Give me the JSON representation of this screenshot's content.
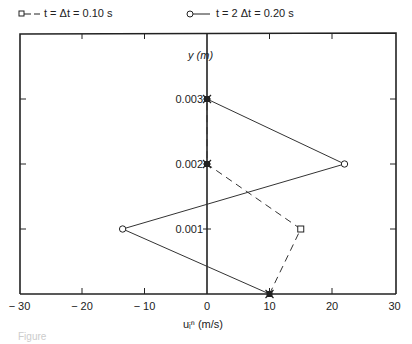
{
  "legend": {
    "series1_label": "t = Δt = 0.10 s",
    "series2_label": "t = 2 Δt = 0.20 s"
  },
  "axes": {
    "x_label": "uᵢⁿ  (m/s)",
    "y_label": "y (m)"
  },
  "caption": "Figure",
  "chart_data": {
    "type": "line",
    "title": "",
    "xlabel": "u (m/s)",
    "ylabel": "y (m)",
    "xlim": [
      -30,
      30
    ],
    "ylim": [
      0,
      0.004
    ],
    "x_ticks": [
      -30,
      -20,
      -10,
      0,
      10,
      20,
      30
    ],
    "x_tick_labels": [
      "− 30",
      "− 20",
      "− 10",
      "0",
      "10",
      "20",
      "30"
    ],
    "y_ticks": [
      0.001,
      0.002,
      0.003
    ],
    "y_tick_labels": [
      "0.001",
      "0.002",
      "0.003"
    ],
    "grid": false,
    "legend_position": "top",
    "series": [
      {
        "name": "t = Δt = 0.10 s",
        "style": "dashed",
        "marker": "square",
        "points": [
          [
            10,
            0
          ],
          [
            15,
            0.001
          ],
          [
            0,
            0.002
          ],
          [
            0,
            0.003
          ]
        ]
      },
      {
        "name": "t = 2 Δt = 0.20 s",
        "style": "solid",
        "marker": "circle",
        "points": [
          [
            10,
            0
          ],
          [
            -13.5,
            0.001
          ],
          [
            22,
            0.002
          ],
          [
            0,
            0.003
          ]
        ]
      }
    ],
    "boundary_points": [
      [
        10,
        0
      ],
      [
        0,
        0.002
      ],
      [
        0,
        0.003
      ]
    ]
  }
}
